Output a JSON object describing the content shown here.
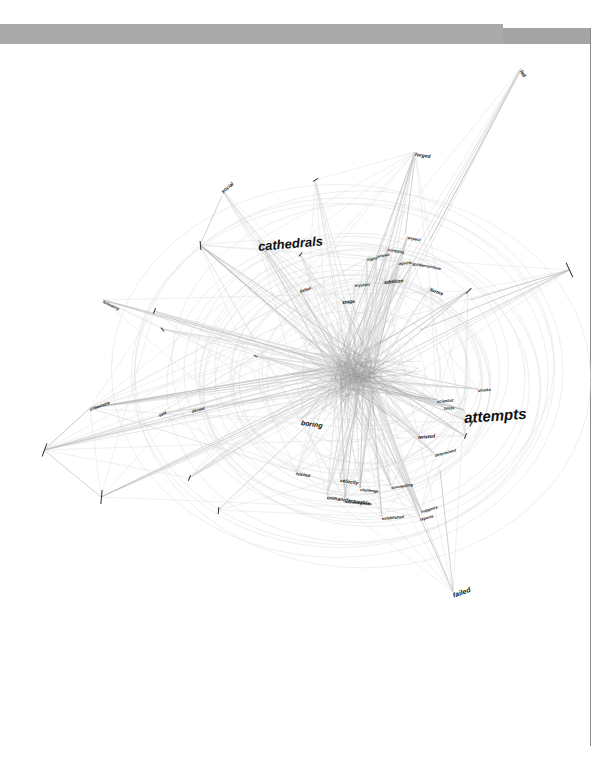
{
  "page": {
    "background": "#ffffff",
    "bar_color": "#a9a9a9",
    "rule_color": "#8a8a8a"
  },
  "diagram": {
    "type": "word co-occurrence network graph",
    "edge_color": "#c8c8c8",
    "hub_center": [
      355,
      375
    ],
    "nodes": [
      {
        "id": "cathedrals",
        "label": "cathedrals",
        "x": 258,
        "y": 240,
        "size": "s4",
        "rot": -5
      },
      {
        "id": "attempts",
        "label": "attempts",
        "x": 464,
        "y": 410,
        "size": "s5",
        "rot": -4
      },
      {
        "id": "forged",
        "label": "forged",
        "x": 415,
        "y": 152,
        "size": "s2",
        "rot": 8
      },
      {
        "id": "fail",
        "label": "fail",
        "x": 521,
        "y": 68,
        "size": "s2",
        "rot": 60
      },
      {
        "id": "social",
        "label": "social",
        "x": 222,
        "y": 190,
        "size": "s2",
        "rot": -40
      },
      {
        "id": "failed",
        "label": "failed",
        "x": 453,
        "y": 592,
        "size": "s3",
        "rot": -20
      },
      {
        "id": "boring",
        "label": "boring",
        "x": 301,
        "y": 419,
        "size": "s3",
        "rot": 8
      },
      {
        "id": "twisted",
        "label": "twisted",
        "x": 418,
        "y": 435,
        "size": "s2",
        "rot": -5
      },
      {
        "id": "addition",
        "label": "addition",
        "x": 384,
        "y": 280,
        "size": "s2",
        "rot": -5
      },
      {
        "id": "forms",
        "label": "forms",
        "x": 430,
        "y": 287,
        "size": "s2",
        "rot": 20
      },
      {
        "id": "stage",
        "label": "stage",
        "x": 342,
        "y": 300,
        "size": "s2",
        "rot": -5
      },
      {
        "id": "defeat",
        "label": "defeat",
        "x": 300,
        "y": 290,
        "size": "s1",
        "rot": -20
      },
      {
        "id": "mystery",
        "label": "mystery",
        "x": 355,
        "y": 284,
        "size": "s1",
        "rot": -5
      },
      {
        "id": "expect",
        "label": "expect",
        "x": 408,
        "y": 236,
        "size": "s1",
        "rot": 10
      },
      {
        "id": "contains",
        "label": "contains",
        "x": 388,
        "y": 248,
        "size": "s1",
        "rot": 10
      },
      {
        "id": "signs",
        "label": "signs",
        "x": 367,
        "y": 258,
        "size": "s1",
        "rot": -10
      },
      {
        "id": "solved",
        "label": "solved",
        "x": 377,
        "y": 255,
        "size": "s1",
        "rot": -10
      },
      {
        "id": "agents",
        "label": "agents",
        "x": 399,
        "y": 262,
        "size": "s1",
        "rot": -5
      },
      {
        "id": "goldenrainbow",
        "label": "goldenrainbow",
        "x": 413,
        "y": 262,
        "size": "s1",
        "rot": 10
      },
      {
        "id": "scientist",
        "label": "scientist",
        "x": 437,
        "y": 400,
        "size": "s1",
        "rot": -5
      },
      {
        "id": "limits",
        "label": "limits",
        "x": 444,
        "y": 407,
        "size": "s1",
        "rot": -5
      },
      {
        "id": "sharks",
        "label": "sharks",
        "x": 478,
        "y": 389,
        "size": "s1",
        "rot": -5
      },
      {
        "id": "velocity",
        "label": "velocity",
        "x": 340,
        "y": 478,
        "size": "s2",
        "rot": 8
      },
      {
        "id": "challenge",
        "label": "challenge",
        "x": 360,
        "y": 488,
        "size": "s1",
        "rot": 5
      },
      {
        "id": "succeeding",
        "label": "succeeding",
        "x": 391,
        "y": 486,
        "size": "s1",
        "rot": -8
      },
      {
        "id": "unmanufacturable",
        "label": "unmanufacturable",
        "x": 327,
        "y": 495,
        "size": "s2",
        "rot": 8
      },
      {
        "id": "advantageous",
        "label": "advantageous",
        "x": 345,
        "y": 500,
        "size": "s1",
        "rot": 5
      },
      {
        "id": "established",
        "label": "established",
        "x": 382,
        "y": 517,
        "size": "s1",
        "rot": -5
      },
      {
        "id": "supports",
        "label": "supports",
        "x": 421,
        "y": 510,
        "size": "s1",
        "rot": -15
      },
      {
        "id": "reports",
        "label": "reports",
        "x": 420,
        "y": 518,
        "size": "s1",
        "rot": -15
      },
      {
        "id": "fetched",
        "label": "fetched",
        "x": 296,
        "y": 472,
        "size": "s1",
        "rot": 8
      },
      {
        "id": "determined",
        "label": "determined",
        "x": 435,
        "y": 454,
        "size": "s1",
        "rot": -15
      },
      {
        "id": "following",
        "label": "following",
        "x": 103,
        "y": 300,
        "size": "s1",
        "rot": 25
      },
      {
        "id": "unbeatable",
        "label": "unbeatable",
        "x": 90,
        "y": 408,
        "size": "s1",
        "rot": -20
      },
      {
        "id": "said",
        "label": "said",
        "x": 159,
        "y": 414,
        "size": "s1",
        "rot": -25
      },
      {
        "id": "denied",
        "label": "denied",
        "x": 192,
        "y": 410,
        "size": "s1",
        "rot": -15
      }
    ],
    "ticks": [
      {
        "x": 44,
        "y": 450,
        "len": 14,
        "rot": 20
      },
      {
        "x": 101,
        "y": 497,
        "len": 14,
        "rot": 5
      },
      {
        "x": 154,
        "y": 311,
        "len": 6,
        "rot": 20
      },
      {
        "x": 162,
        "y": 329,
        "len": 5,
        "rot": -40
      },
      {
        "x": 569,
        "y": 270,
        "len": 16,
        "rot": -25
      },
      {
        "x": 468,
        "y": 291,
        "len": 8,
        "rot": 45
      },
      {
        "x": 200,
        "y": 245,
        "len": 9,
        "rot": -5
      },
      {
        "x": 315,
        "y": 180,
        "len": 6,
        "rot": 60
      },
      {
        "x": 218,
        "y": 510,
        "len": 7,
        "rot": 5
      },
      {
        "x": 189,
        "y": 478,
        "len": 6,
        "rot": 20
      },
      {
        "x": 471,
        "y": 423,
        "len": 7,
        "rot": 30
      },
      {
        "x": 465,
        "y": 436,
        "len": 6,
        "rot": 20
      },
      {
        "x": 255,
        "y": 356,
        "len": 4,
        "rot": -60
      },
      {
        "x": 300,
        "y": 254,
        "len": 5,
        "rot": 40
      }
    ]
  }
}
